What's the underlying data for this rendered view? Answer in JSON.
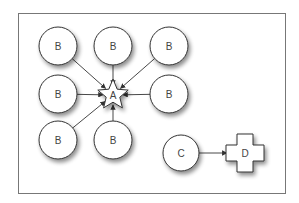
{
  "diagram": {
    "frame": {
      "x": 18,
      "y": 13,
      "width": 267,
      "height": 180,
      "stroke": "#777777"
    },
    "style": {
      "node_fill": "#ffffff",
      "node_stroke": "#333333",
      "edge_color": "#333333",
      "label_color": "#444444"
    },
    "nodes": [
      {
        "id": "b1",
        "label": "B",
        "shape": "circle",
        "cx": 58,
        "cy": 46,
        "r": 19
      },
      {
        "id": "b2",
        "label": "B",
        "shape": "circle",
        "cx": 113,
        "cy": 46,
        "r": 19
      },
      {
        "id": "b3",
        "label": "B",
        "shape": "circle",
        "cx": 169,
        "cy": 46,
        "r": 19
      },
      {
        "id": "b4",
        "label": "B",
        "shape": "circle",
        "cx": 58,
        "cy": 94,
        "r": 19
      },
      {
        "id": "a",
        "label": "A",
        "shape": "star",
        "cx": 113,
        "cy": 95,
        "r": 16
      },
      {
        "id": "b5",
        "label": "B",
        "shape": "circle",
        "cx": 169,
        "cy": 94,
        "r": 19
      },
      {
        "id": "b6",
        "label": "B",
        "shape": "circle",
        "cx": 58,
        "cy": 140,
        "r": 19
      },
      {
        "id": "b7",
        "label": "B",
        "shape": "circle",
        "cx": 113,
        "cy": 140,
        "r": 19
      },
      {
        "id": "c",
        "label": "C",
        "shape": "circle",
        "cx": 181,
        "cy": 153,
        "r": 18
      },
      {
        "id": "d",
        "label": "D",
        "shape": "cross",
        "cx": 245,
        "cy": 153,
        "r": 19
      }
    ],
    "edges": [
      {
        "from": "b1",
        "to": "a"
      },
      {
        "from": "b2",
        "to": "a"
      },
      {
        "from": "b3",
        "to": "a"
      },
      {
        "from": "b4",
        "to": "a"
      },
      {
        "from": "b5",
        "to": "a"
      },
      {
        "from": "b6",
        "to": "a"
      },
      {
        "from": "b7",
        "to": "a"
      },
      {
        "from": "c",
        "to": "d"
      }
    ]
  }
}
